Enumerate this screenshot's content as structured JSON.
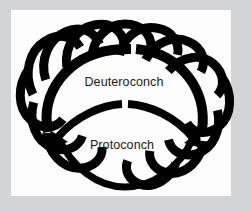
{
  "figure": {
    "kind": "scientific-diagram",
    "background_color": "#d3d4d6",
    "panel_color": "#fdfdfd",
    "ink_color": "#000000",
    "text_color": "#1b1b1b"
  },
  "labels": {
    "deuteroconch": "Deuteroconch",
    "protoconch": "Protoconch"
  },
  "structures": {
    "deuteroconch_chamber": "deuteroconch-chamber",
    "protoconch_chamber": "protoconch-chamber",
    "peripheral_chambers": "peripheral-chamber-ring",
    "peripheral_chamber_count": 14
  }
}
